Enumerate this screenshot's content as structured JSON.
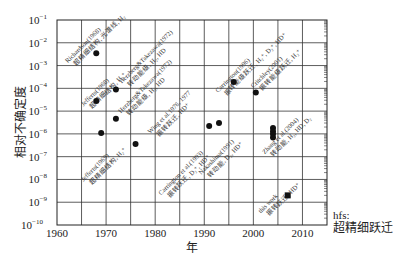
{
  "chart_data": {
    "type": "scatter",
    "title": "",
    "xlabel": "年",
    "ylabel": "相对不确定度",
    "xlim": [
      1960,
      2015
    ],
    "ylim_exponent": [
      -10,
      -1
    ],
    "yscale": "log",
    "grid": true,
    "x_ticks": [
      1960,
      1970,
      1980,
      1990,
      2000,
      2010
    ],
    "x_gridlines": [
      1965,
      1970,
      1975,
      1980,
      1985,
      1990,
      1995,
      2000,
      2005,
      2010
    ],
    "y_ticks": [
      {
        "exp": -1,
        "label": "10",
        "sup": "−1"
      },
      {
        "exp": -2,
        "label": "10",
        "sup": "−2"
      },
      {
        "exp": -3,
        "label": "10",
        "sup": "−3"
      },
      {
        "exp": -4,
        "label": "10",
        "sup": "−4"
      },
      {
        "exp": -5,
        "label": "10",
        "sup": "−5"
      },
      {
        "exp": -6,
        "label": "10",
        "sup": "−6"
      },
      {
        "exp": -7,
        "label": "10",
        "sup": "−7"
      },
      {
        "exp": -8,
        "label": "10",
        "sup": "−8"
      },
      {
        "exp": -9,
        "label": "10",
        "sup": "−9"
      },
      {
        "exp": -10,
        "label": "10",
        "sup": "−10"
      }
    ],
    "series": [
      {
        "name": "previous measurements",
        "marker": "circle",
        "points": [
          {
            "x": 1968,
            "y": 0.0035
          },
          {
            "x": 1968,
            "y": 2.8e-05
          },
          {
            "x": 1969,
            "y": 1.1e-06
          },
          {
            "x": 1972,
            "y": 9e-05
          },
          {
            "x": 1972,
            "y": 4.6e-06
          },
          {
            "x": 1976,
            "y": 3.6e-07
          },
          {
            "x": 1991,
            "y": 2.2e-06
          },
          {
            "x": 1993,
            "y": 3e-06
          },
          {
            "x": 1996,
            "y": 0.00019
          },
          {
            "x": 2000.5,
            "y": 6.5e-05
          },
          {
            "x": 2004,
            "y": 1.8e-06
          },
          {
            "x": 2004,
            "y": 1.3e-06
          },
          {
            "x": 2004,
            "y": 1e-06
          },
          {
            "x": 2004,
            "y": 7e-07
          }
        ]
      },
      {
        "name": "this work",
        "marker": "square",
        "points": [
          {
            "x": 2007,
            "y": 2e-09
          }
        ]
      }
    ],
    "annotations": [
      {
        "text": "Richardson(1968)",
        "text2": "超精细结构, 光谱线, H₂",
        "x": 1962.2,
        "yexp": -2.9
      },
      {
        "text": "Jefferts(1968)",
        "text2": "超精细结构, H₂⁺",
        "x": 1965.4,
        "yexp": -4.8
      },
      {
        "text": "Jefferts(1969)",
        "text2": "超精细结构, H₂⁺",
        "x": 1965.4,
        "yexp": -8.1
      },
      {
        "text": "Herzberg&Takezawa(1972)",
        "text2": "转动能级, H₂, HD",
        "x": 1973.2,
        "yexp": -3.8
      },
      {
        "text": "Herzberg&Takezawa(1972)",
        "text2": "转动能级, H₂, HD",
        "x": 1973.0,
        "yexp": -5.1
      },
      {
        "text": "Wing et al.1976, 1977",
        "text2": "振转跃迁, HD⁺",
        "x": 1979.0,
        "yexp": -6.0
      },
      {
        "text": "Carrington et al.(1993)",
        "text2": "振转跃迁, D₂⁺, HD⁺",
        "x": 1981.2,
        "yexp": -8.7
      },
      {
        "text": "Nakashima(1991)",
        "text2": "转动能, D₂, HD⁺",
        "x": 1989.4,
        "yexp": -7.8
      },
      {
        "text": "Carrington(1996)",
        "text2": "振转能级跃迁, H₂⁺, D₂⁺, HD⁺",
        "x": 1992.8,
        "yexp": -4.2
      },
      {
        "text": "Critchley(2001)",
        "text2": "振转能级跃迁, H₂⁺",
        "x": 2000.0,
        "yexp": -4.0
      },
      {
        "text": "Zhang et al.(2004)",
        "text2": "转动能, H₂, HD, D₂",
        "x": 2002.3,
        "yexp": -6.9
      },
      {
        "text": "this work",
        "text2": "振转跃迁, HD⁺",
        "x": 2001.5,
        "yexp": -9.5
      }
    ],
    "legend_note": {
      "line1": "hfs:",
      "line2": "超精细跃迁"
    }
  }
}
